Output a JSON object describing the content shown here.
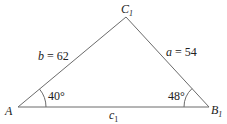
{
  "diagram": {
    "type": "triangle",
    "vertices": {
      "A": {
        "label": "A",
        "sub": ""
      },
      "B": {
        "label": "B",
        "sub": "1"
      },
      "C": {
        "label": "C",
        "sub": "1"
      }
    },
    "sides": {
      "b": {
        "var": "b",
        "eq": " = 62",
        "value": 62
      },
      "a": {
        "var": "a",
        "eq": " = 54",
        "value": 54
      },
      "c": {
        "var": "c",
        "sub": "1"
      }
    },
    "angles": {
      "A": {
        "text": "40°",
        "value": 40
      },
      "B": {
        "text": "48°",
        "value": 48
      }
    },
    "colors": {
      "line": "#6b6b6b",
      "text": "#222222"
    }
  }
}
